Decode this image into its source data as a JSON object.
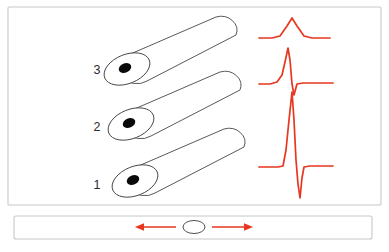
{
  "figure": {
    "background_color": "#ffffff",
    "frame_color": "#c8c8c8",
    "trace_color": "#e8361f",
    "outline_color": "#3b3b3b",
    "electrode_color": "#0a0a0a"
  },
  "panels": {
    "upper": {
      "name": "fiber-panel",
      "x": 8,
      "y": 7,
      "width": 373,
      "height": 198
    },
    "lower": {
      "name": "bar-panel",
      "x": 14,
      "y": 216,
      "width": 358,
      "height": 23
    }
  },
  "fibers": [
    {
      "label": "3",
      "label_x": 97,
      "label_y": 71,
      "cap_cx": 127,
      "cap_cy": 69,
      "tip_x": 226,
      "tip_y": 26,
      "dot_cx": 125,
      "dot_cy": 68,
      "amplitude_rank": 1
    },
    {
      "label": "2",
      "label_x": 97,
      "label_y": 128,
      "cap_cx": 131,
      "cap_cy": 124,
      "tip_x": 230,
      "tip_y": 81,
      "dot_cx": 129,
      "dot_cy": 123,
      "amplitude_rank": 2
    },
    {
      "label": "1",
      "label_x": 97,
      "label_y": 186,
      "cap_cx": 135,
      "cap_cy": 181,
      "tip_x": 234,
      "tip_y": 138,
      "dot_cx": 133,
      "dot_cy": 180,
      "amplitude_rank": 3
    }
  ],
  "chart_data": {
    "type": "line",
    "xlabel": "",
    "ylabel": "",
    "grid": false,
    "legend": "none",
    "trace_color": "#e8361f",
    "series": [
      {
        "name": "trace-fiber-3",
        "fiber_label": "3",
        "shape": "small-positive-bump",
        "baseline_y": 38,
        "peak_y": 18,
        "peak_amplitude": 20,
        "negative_amplitude": 0,
        "x_start": 259,
        "x_end": 330,
        "points": [
          [
            259,
            38
          ],
          [
            272,
            38
          ],
          [
            280,
            36
          ],
          [
            287,
            26
          ],
          [
            292,
            18
          ],
          [
            297,
            26
          ],
          [
            304,
            36
          ],
          [
            312,
            38
          ],
          [
            330,
            38
          ]
        ]
      },
      {
        "name": "trace-fiber-2",
        "fiber_label": "2",
        "shape": "biphasic-sharp-positive",
        "baseline_y": 84,
        "peak_y": 48,
        "peak_amplitude": 36,
        "negative_amplitude": 11,
        "x_start": 259,
        "x_end": 333,
        "points": [
          [
            259,
            84
          ],
          [
            270,
            84
          ],
          [
            277,
            82
          ],
          [
            282,
            75
          ],
          [
            285,
            62
          ],
          [
            288,
            48
          ],
          [
            290,
            60
          ],
          [
            292,
            84
          ],
          [
            294,
            95
          ],
          [
            297,
            84
          ],
          [
            303,
            83
          ],
          [
            333,
            83
          ]
        ]
      },
      {
        "name": "trace-fiber-1",
        "fiber_label": "1",
        "shape": "biphasic-large-spike",
        "baseline_y": 167,
        "peak_y": 92,
        "peak_amplitude": 75,
        "negative_amplitude": 31,
        "x_start": 259,
        "x_end": 333,
        "points": [
          [
            259,
            167
          ],
          [
            278,
            167
          ],
          [
            283,
            166
          ],
          [
            286,
            150
          ],
          [
            289,
            120
          ],
          [
            292,
            92
          ],
          [
            294,
            120
          ],
          [
            296,
            160
          ],
          [
            298,
            184
          ],
          [
            300,
            198
          ],
          [
            302,
            178
          ],
          [
            304,
            167
          ],
          [
            310,
            166
          ],
          [
            333,
            166
          ]
        ]
      }
    ]
  },
  "bar": {
    "name": "fiber-cross-section-bar",
    "ellipse": {
      "cx": 194,
      "cy": 227,
      "rx": 11,
      "ry": 6.5
    },
    "arrows": [
      {
        "name": "arrow-left",
        "direction": "left",
        "from_x": 176,
        "to_x": 136,
        "y": 227
      },
      {
        "name": "arrow-right",
        "direction": "right",
        "from_x": 212,
        "to_x": 252,
        "y": 227
      }
    ]
  }
}
